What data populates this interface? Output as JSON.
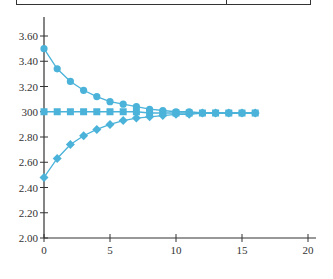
{
  "chart_data": {
    "type": "line",
    "title": "",
    "xlabel": "",
    "ylabel": "",
    "xlim": [
      0,
      20
    ],
    "ylim": [
      2.0,
      3.6
    ],
    "x_ticks": [
      0,
      5,
      10,
      15,
      20
    ],
    "x_tick_labels": [
      "0",
      "5",
      "10",
      "15",
      "20"
    ],
    "y_ticks": [
      2.0,
      2.2,
      2.4,
      2.6,
      2.8,
      3.0,
      3.2,
      3.4,
      3.6
    ],
    "y_tick_labels": [
      "2.00",
      "2.20",
      "2.40",
      "2.60",
      "2.80",
      "300",
      "3.20",
      "3.40",
      "3.60"
    ],
    "grid": false,
    "legend": "none",
    "color": "#4bb3d9",
    "x": [
      0,
      1,
      2,
      3,
      4,
      5,
      6,
      7,
      8,
      9,
      10,
      11,
      12,
      13,
      14,
      15,
      16
    ],
    "series": [
      {
        "name": "from-above",
        "marker": "circle",
        "values": [
          3.5,
          3.34,
          3.24,
          3.17,
          3.12,
          3.08,
          3.06,
          3.04,
          3.02,
          3.01,
          3.0,
          3.0,
          2.99,
          2.99,
          2.99,
          2.99,
          2.99
        ]
      },
      {
        "name": "constant",
        "marker": "square",
        "values": [
          3.0,
          3.0,
          3.0,
          3.0,
          3.0,
          3.0,
          3.0,
          3.0,
          2.99,
          2.99,
          2.99,
          2.99,
          2.99,
          2.99,
          2.99,
          2.99,
          2.99
        ]
      },
      {
        "name": "from-below",
        "marker": "diamond",
        "values": [
          2.48,
          2.63,
          2.74,
          2.81,
          2.86,
          2.9,
          2.93,
          2.95,
          2.96,
          2.97,
          2.98,
          2.98,
          2.99,
          2.99,
          2.99,
          2.99,
          2.99
        ]
      }
    ]
  }
}
